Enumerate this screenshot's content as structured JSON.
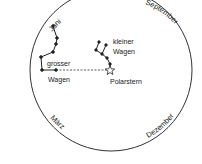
{
  "diagram": {
    "months": {
      "top_left": "Juni",
      "top_right": "September",
      "bottom_left": "März",
      "bottom_right": "Dezember"
    },
    "constellations": {
      "big_dipper_line1": "grosser",
      "big_dipper_line2": "Wagen",
      "little_dipper_line1": "kleiner",
      "little_dipper_line2": "Wagen"
    },
    "polaris": "Polarstern",
    "colors": {
      "ink": "#222222",
      "background": "#ffffff"
    }
  }
}
